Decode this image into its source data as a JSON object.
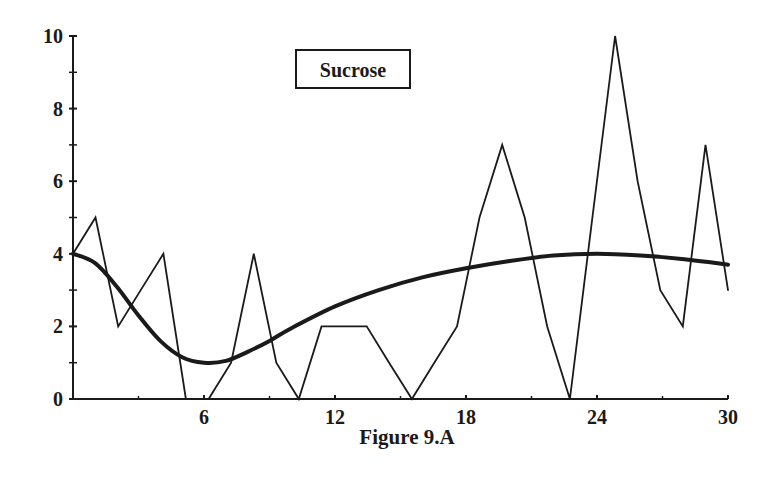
{
  "chart_data": {
    "type": "line",
    "title": "Sucrose",
    "caption": "Figure 9.A",
    "xlabel": "",
    "ylabel": "",
    "xlim": [
      0,
      30
    ],
    "ylim": [
      0,
      10
    ],
    "x_ticks": [
      6,
      12,
      18,
      24,
      30
    ],
    "y_ticks": [
      0,
      2,
      4,
      6,
      8,
      10
    ],
    "y_minor_ticks": [
      1,
      3,
      5,
      7,
      9
    ],
    "x_minor_ticks": [
      3,
      9,
      15,
      21,
      27
    ],
    "grid": false,
    "legend": {
      "entries": [
        "Sucrose"
      ],
      "position": "top-center"
    },
    "series": [
      {
        "name": "Sucrose (observed)",
        "style": "thin-line",
        "x": [
          0,
          1.03,
          2.07,
          3.1,
          4.14,
          5.17,
          6.21,
          7.24,
          8.28,
          9.31,
          10.34,
          11.38,
          12.41,
          13.45,
          14.48,
          15.52,
          16.55,
          17.59,
          18.62,
          19.66,
          20.69,
          21.72,
          22.76,
          23.79,
          24.83,
          25.86,
          26.9,
          27.93,
          28.97,
          30
        ],
        "values": [
          4,
          5,
          2,
          3,
          4,
          0,
          0,
          1,
          4,
          1,
          0,
          2,
          2,
          2,
          1,
          0,
          1,
          2,
          5,
          7,
          5,
          2,
          0,
          5,
          10,
          6,
          3,
          2,
          7,
          3
        ]
      },
      {
        "name": "Sucrose (smoothed trend)",
        "style": "thick-line",
        "x": [
          0,
          1,
          2,
          3,
          4,
          5,
          6,
          7,
          8,
          9,
          10,
          12,
          14,
          16,
          18,
          20,
          22,
          24,
          26,
          28,
          30
        ],
        "values": [
          4.0,
          3.75,
          3.1,
          2.3,
          1.6,
          1.15,
          1.0,
          1.05,
          1.3,
          1.6,
          1.95,
          2.55,
          3.0,
          3.35,
          3.6,
          3.8,
          3.95,
          4.0,
          3.95,
          3.85,
          3.7
        ]
      }
    ]
  },
  "colors": {
    "ink": "#1a1a1a",
    "background": "#ffffff"
  }
}
